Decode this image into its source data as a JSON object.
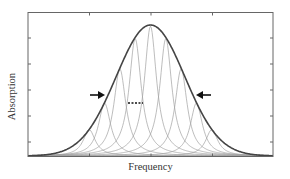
{
  "chart_data": {
    "type": "line",
    "title": "",
    "xlabel": "Frequency",
    "ylabel": "Absorption",
    "grid": false,
    "legend": null,
    "x_ticks_shown": 3,
    "y_ticks_shown": 5,
    "tick_labels": false,
    "envelope": {
      "name": "Inhomogeneous envelope",
      "shape": "gaussian",
      "center": 0.5,
      "sigma": 0.14,
      "peak": 1.0,
      "color": "#444444"
    },
    "components": {
      "name": "Homogeneous lines",
      "count": 9,
      "centers": [
        0.25,
        0.3125,
        0.375,
        0.4375,
        0.5,
        0.5625,
        0.625,
        0.6875,
        0.75
      ],
      "shape": "lorentzian",
      "color": "#9a9a9a"
    },
    "annotations": [
      {
        "type": "arrow",
        "direction": "right",
        "label": "",
        "position": "left half-maximum"
      },
      {
        "type": "arrow",
        "direction": "left",
        "label": "",
        "position": "right half-maximum"
      },
      {
        "type": "dashed-line",
        "label": "",
        "position": "width of single component"
      }
    ],
    "xlim": [
      0,
      1
    ],
    "ylim": [
      0,
      1.1
    ]
  },
  "labels": {
    "x": "Frequency",
    "y": "Absorption"
  },
  "colors": {
    "axis": "#555555",
    "envelope": "#444444",
    "component": "#a0a0a0",
    "arrow": "#111111"
  }
}
